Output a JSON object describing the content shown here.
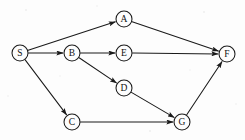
{
  "diagram": {
    "type": "directed-graph",
    "width": 245,
    "height": 140,
    "background_color": "#fdfdfd",
    "stroke_color": "#1a1a1a",
    "label_color": "#111111",
    "node_radius": 8,
    "nodes": [
      {
        "id": "S",
        "label": "S",
        "cx": 20,
        "cy": 53,
        "role": "source"
      },
      {
        "id": "A",
        "label": "A",
        "cx": 124,
        "cy": 19,
        "role": "intermediate"
      },
      {
        "id": "B",
        "label": "B",
        "cx": 72,
        "cy": 53,
        "role": "intermediate"
      },
      {
        "id": "E",
        "label": "E",
        "cx": 124,
        "cy": 53,
        "role": "intermediate"
      },
      {
        "id": "D",
        "label": "D",
        "cx": 124,
        "cy": 88,
        "role": "intermediate"
      },
      {
        "id": "C",
        "label": "C",
        "cx": 72,
        "cy": 122,
        "role": "intermediate"
      },
      {
        "id": "G",
        "label": "G",
        "cx": 182,
        "cy": 122,
        "role": "intermediate"
      },
      {
        "id": "F",
        "label": "F",
        "cx": 227,
        "cy": 54,
        "role": "sink"
      }
    ],
    "edges": [
      {
        "id": "S-A",
        "from": "S",
        "to": "A",
        "directed": true
      },
      {
        "id": "S-B",
        "from": "S",
        "to": "B",
        "directed": true
      },
      {
        "id": "S-C",
        "from": "S",
        "to": "C",
        "directed": true
      },
      {
        "id": "A-F",
        "from": "A",
        "to": "F",
        "directed": true
      },
      {
        "id": "B-E",
        "from": "B",
        "to": "E",
        "directed": true
      },
      {
        "id": "B-D",
        "from": "B",
        "to": "D",
        "directed": true
      },
      {
        "id": "E-F",
        "from": "E",
        "to": "F",
        "directed": true
      },
      {
        "id": "D-G",
        "from": "D",
        "to": "G",
        "directed": true
      },
      {
        "id": "C-G",
        "from": "C",
        "to": "G",
        "directed": true
      },
      {
        "id": "G-F",
        "from": "G",
        "to": "F",
        "directed": true
      }
    ],
    "specks": [
      {
        "cx": 26,
        "cy": 10,
        "r": 0.9
      },
      {
        "cx": 97,
        "cy": 6,
        "r": 0.8
      },
      {
        "cx": 204,
        "cy": 12,
        "r": 0.9
      },
      {
        "cx": 8,
        "cy": 96,
        "r": 0.8
      },
      {
        "cx": 150,
        "cy": 131,
        "r": 0.9
      },
      {
        "cx": 236,
        "cy": 104,
        "r": 0.8
      },
      {
        "cx": 60,
        "cy": 76,
        "r": 0.7
      },
      {
        "cx": 190,
        "cy": 70,
        "r": 0.7
      }
    ]
  }
}
